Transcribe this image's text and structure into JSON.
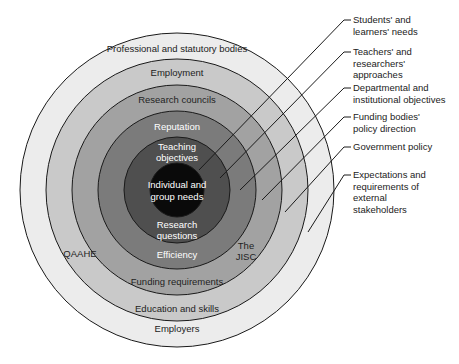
{
  "diagram": {
    "center": [
      177,
      190
    ],
    "rings": [
      {
        "label": "Professional and statutory bodies",
        "bottom_label": "Employers",
        "radius": 157,
        "color": "#ececec"
      },
      {
        "label": "Employment",
        "bottom_label": "Education and skills",
        "radius": 131,
        "color": "#c9c9c9"
      },
      {
        "label": "Research councils",
        "bottom_label": "Funding requirements",
        "radius": 105,
        "color": "#a2a2a2"
      },
      {
        "label": "Reputation",
        "bottom_label": "Efficiency",
        "radius": 79,
        "color": "#7b7b7b"
      },
      {
        "label": "Teaching objectives",
        "bottom_label": "Research questions",
        "radius": 53,
        "color": "#4f4f4f"
      },
      {
        "label": "Individual and group needs",
        "radius": 27,
        "color": "#0a0a0a"
      }
    ],
    "inner_labels": {
      "teaching_line1": "Teaching",
      "teaching_line2": "objectives",
      "individual_line1": "Individual and",
      "individual_line2": "group needs",
      "research_line1": "Research",
      "research_line2": "questions",
      "qaahe": "QAAHE",
      "jisc_line1": "The",
      "jisc_line2": "JISC"
    },
    "side_labels": [
      {
        "text": "Students' and\nlearners' needs",
        "top": 14
      },
      {
        "text": "Teachers' and\nresearchers'\napproaches",
        "top": 46
      },
      {
        "text": "Departmental and\ninstitutional objectives",
        "top": 82
      },
      {
        "text": "Funding bodies'\npolicy direction",
        "top": 111
      },
      {
        "text": "Government policy",
        "top": 141
      },
      {
        "text": "Expectations and\nrequirements of\nexternal\nstakeholders",
        "top": 169
      }
    ]
  }
}
